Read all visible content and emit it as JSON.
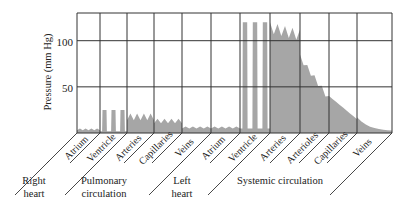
{
  "chart_data": {
    "type": "area",
    "title": "",
    "xlabel": "",
    "ylabel": "Pressure (mm Hg)",
    "ylim": [
      0,
      130
    ],
    "yticks": [
      50,
      100
    ],
    "grid": true,
    "legend": null,
    "segments": [
      {
        "label": "Atrium",
        "group": "Right heart"
      },
      {
        "label": "Ventricle",
        "group": "Right heart"
      },
      {
        "label": "Arteries",
        "group": "Pulmonary circulation"
      },
      {
        "label": "Capillaries",
        "group": "Pulmonary circulation"
      },
      {
        "label": "Veins",
        "group": "Pulmonary circulation"
      },
      {
        "label": "Atrium",
        "group": "Left heart"
      },
      {
        "label": "Ventricle",
        "group": "Left heart"
      },
      {
        "label": "Arteries",
        "group": "Systemic circulation"
      },
      {
        "label": "Arterioles",
        "group": "Systemic circulation"
      },
      {
        "label": "Capillaries",
        "group": "Systemic circulation"
      },
      {
        "label": "Veins",
        "group": "Systemic circulation"
      }
    ],
    "groups": [
      {
        "label_lines": [
          "Right",
          "heart"
        ]
      },
      {
        "label_lines": [
          "Pulmonary",
          "circulation"
        ]
      },
      {
        "label_lines": [
          "Left",
          "heart"
        ]
      },
      {
        "label_lines": [
          "Systemic circulation"
        ]
      }
    ],
    "series": [
      {
        "name": "Blood pressure",
        "description": "Approximate pressure profile (mm Hg) across circulatory segments",
        "segment_ranges": [
          {
            "segment": "Right heart Atrium",
            "min": 2,
            "max": 6
          },
          {
            "segment": "Right heart Ventricle",
            "min": 2,
            "max": 25,
            "pulses": 3
          },
          {
            "segment": "Pulmonary Arteries",
            "min": 10,
            "max": 25
          },
          {
            "segment": "Pulmonary Capillaries",
            "min": 8,
            "max": 18
          },
          {
            "segment": "Pulmonary Veins",
            "min": 4,
            "max": 8
          },
          {
            "segment": "Left heart Atrium",
            "min": 4,
            "max": 8
          },
          {
            "segment": "Left heart Ventricle",
            "min": 5,
            "max": 120,
            "pulses": 3
          },
          {
            "segment": "Systemic Arteries",
            "min": 80,
            "max": 120
          },
          {
            "segment": "Systemic Arterioles",
            "min": 40,
            "max": 85
          },
          {
            "segment": "Systemic Capillaries",
            "min": 15,
            "max": 40
          },
          {
            "segment": "Systemic Veins",
            "min": 2,
            "max": 15
          }
        ]
      }
    ]
  },
  "axis": {
    "tick_100": "100",
    "tick_50": "50",
    "ylabel": "Pressure (mm Hg)"
  },
  "colors": {
    "fill": "#a6a6a6",
    "grid": "#333333",
    "text": "#222222"
  }
}
